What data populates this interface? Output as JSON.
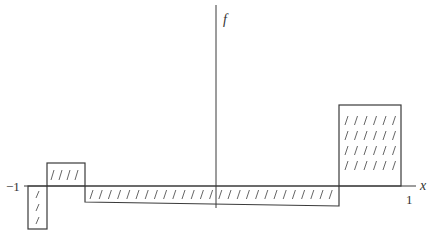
{
  "figure": {
    "function_label": "f",
    "x_axis_label": "x",
    "tick_left": "−1",
    "tick_right": "1",
    "colors": {
      "stroke": "#3a3a3a",
      "hatch": "#555555",
      "background": "#ffffff"
    },
    "segments": [
      {
        "name": "segment-1",
        "x_from": -1.0,
        "x_to": -0.9,
        "sign": "negative",
        "hatch_rows": 3,
        "hatch_cols": 1
      },
      {
        "name": "segment-2",
        "x_from": -0.9,
        "x_to": -0.7,
        "sign": "positive",
        "hatch_rows": 1,
        "hatch_cols": 4
      },
      {
        "name": "segment-3",
        "x_from": -0.7,
        "x_to": 0.63,
        "sign": "negative",
        "hatch_rows": 1,
        "hatch_cols": 27
      },
      {
        "name": "segment-4",
        "x_from": 0.63,
        "x_to": 0.95,
        "sign": "positive",
        "hatch_rows": 4,
        "hatch_cols": 6
      }
    ]
  }
}
